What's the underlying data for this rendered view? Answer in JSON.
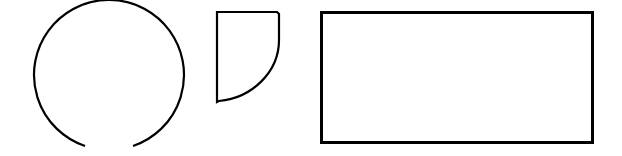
{
  "canvas": {
    "width": 622,
    "height": 156,
    "background": "#ffffff"
  },
  "stroke_color": "#000000",
  "shapes": [
    {
      "type": "open-circle",
      "description": "circle with a gap at the bottom",
      "cx": 108,
      "cy": 78,
      "r": 75,
      "gap_start_x": 85,
      "gap_end_x": 133,
      "stroke_width": 2
    },
    {
      "type": "quarter-sector",
      "description": "shape with straight top and left edges and a curved lower-right edge",
      "x": 217,
      "y": 12,
      "width": 62,
      "height": 90,
      "stroke_width": 2
    },
    {
      "type": "rectangle",
      "x": 321,
      "y": 12,
      "width": 272,
      "height": 131,
      "stroke_width": 3
    }
  ]
}
